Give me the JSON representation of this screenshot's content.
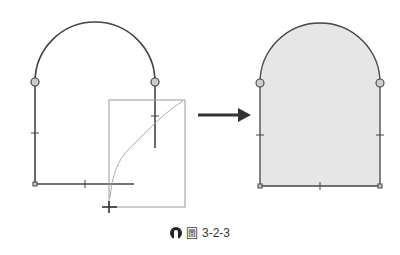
{
  "figure": {
    "caption_label": "圖",
    "caption_number": "3-2-3",
    "left_panel": {
      "description": "open sketch profile with drag cursor"
    },
    "right_panel": {
      "description": "closed shaded arch profile"
    },
    "arrow": "right-arrow",
    "colors": {
      "line": "#444444",
      "fill": "#e6e6e6",
      "box": "#999999",
      "arrow": "#333333"
    }
  }
}
